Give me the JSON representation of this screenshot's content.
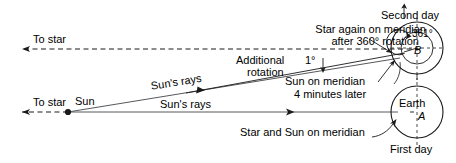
{
  "diagram": {
    "colors": {
      "ink": "#1a1a1a",
      "background": "#ffffff"
    },
    "labels": {
      "to_star_top": "To star",
      "to_star_bottom": "To star",
      "sun": "Sun",
      "suns_rays_upper": "Sun's rays",
      "suns_rays_lower": "Sun's rays",
      "star_again_line1": "Star again on meridian",
      "star_again_line2": "after 360° rotation",
      "additional_line1": "Additional",
      "additional_line2": "rotation",
      "one_degree": "1°",
      "sun_on_meridian_line1": "Sun on meridian",
      "sun_on_meridian_line2": "4 minutes later",
      "star_and_sun_on_meridian": "Star and Sun on meridian",
      "second_day": "Second day",
      "first_day": "First day",
      "earth": "Earth",
      "point_a": "A",
      "point_b": "B",
      "rotation_361": "361°"
    },
    "values": {
      "full_rotation_degrees": "360°",
      "extra_rotation_degrees": "1°",
      "total_rotation_degrees": "361°",
      "time_offset": "4 minutes later"
    },
    "icons": {
      "cursor": "mouse-cursor-icon",
      "arrow_left": "arrow-left-icon",
      "arrow_right": "arrow-right-icon",
      "arrow_down": "arrow-down-icon",
      "rotation_arrow": "rotation-arrow-icon"
    }
  }
}
